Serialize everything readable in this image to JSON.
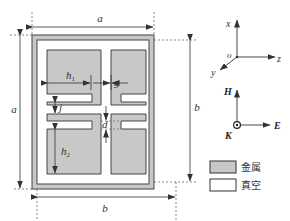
{
  "figure": {
    "type": "unit-cell schematic",
    "dimensions": {
      "a_top": "a",
      "a_left": "a",
      "b_right": "b",
      "b_bottom": "b",
      "h1": "h",
      "h1_sub": "1",
      "h2": "h",
      "h2_sub": "2",
      "g": "g",
      "j": "j",
      "d": "d"
    },
    "axes": {
      "x": "x",
      "y": "y",
      "z": "z",
      "origin": "o"
    },
    "field": {
      "H": "H",
      "E": "E",
      "K": "K"
    },
    "legend": [
      {
        "label": "金属",
        "fill": "#c8c8c8"
      },
      {
        "label": "真空",
        "fill": "#ffffff"
      }
    ]
  },
  "colors": {
    "metal": "#c8c8c8",
    "vacuum": "#ffffff",
    "stroke": "#444444"
  }
}
